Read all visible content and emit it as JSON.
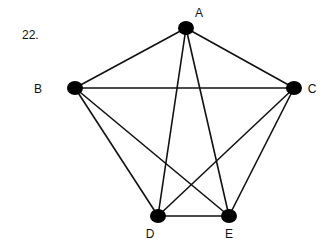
{
  "problem_number": "22.",
  "graph": {
    "type": "complete",
    "colors": {
      "edge": "#111111",
      "node": "#000000",
      "background": "#ffffff"
    },
    "nodes": [
      {
        "id": "A",
        "label": "A",
        "x": 186,
        "y": 28,
        "lx": 199,
        "ly": 17
      },
      {
        "id": "B",
        "label": "B",
        "x": 75,
        "y": 88,
        "lx": 38,
        "ly": 93
      },
      {
        "id": "C",
        "label": "C",
        "x": 294,
        "y": 88,
        "lx": 312,
        "ly": 93
      },
      {
        "id": "D",
        "label": "D",
        "x": 158,
        "y": 216,
        "lx": 150,
        "ly": 238
      },
      {
        "id": "E",
        "label": "E",
        "x": 229,
        "y": 216,
        "lx": 229,
        "ly": 238
      }
    ],
    "edges": [
      [
        "A",
        "B"
      ],
      [
        "A",
        "C"
      ],
      [
        "A",
        "D"
      ],
      [
        "A",
        "E"
      ],
      [
        "B",
        "C"
      ],
      [
        "B",
        "D"
      ],
      [
        "B",
        "E"
      ],
      [
        "C",
        "D"
      ],
      [
        "C",
        "E"
      ],
      [
        "D",
        "E"
      ]
    ]
  }
}
